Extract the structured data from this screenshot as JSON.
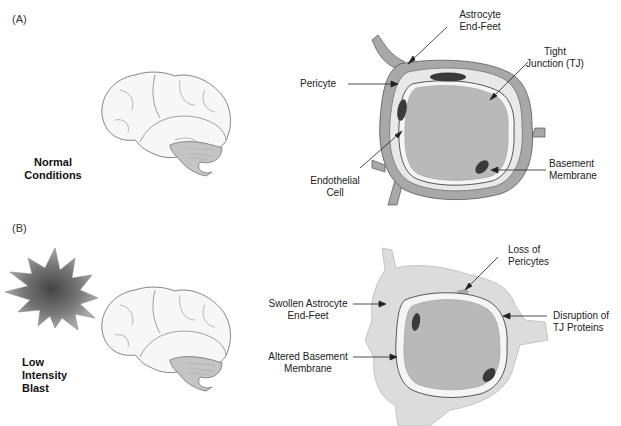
{
  "panels": [
    {
      "id": "A",
      "label": "(A)",
      "condition": [
        "Normal",
        "Conditions"
      ],
      "labels": {
        "astrocyte": [
          "Astrocyte",
          "End-Feet"
        ],
        "tight_junction": [
          "Tight",
          "Junction (TJ)"
        ],
        "pericyte": "Pericyte",
        "endothelial": [
          "Endothelial",
          "Cell"
        ],
        "basement": [
          "Basement",
          "Membrane"
        ]
      }
    },
    {
      "id": "B",
      "label": "(B)",
      "condition": [
        "Low",
        "Intensity",
        "Blast"
      ],
      "labels": {
        "loss_pericytes": [
          "Loss of",
          "Pericytes"
        ],
        "swollen": [
          "Swollen Astrocyte",
          "End-Feet"
        ],
        "disruption": [
          "Disruption of",
          "TJ Proteins"
        ],
        "altered": [
          "Altered Basement",
          "Membrane"
        ]
      }
    }
  ],
  "colors": {
    "astrocyte_normal": "#a8a8a8",
    "astrocyte_swollen": "#dcdcdc",
    "lumen": "#b9b9b9",
    "nucleus": "#3a3a3a",
    "pericyte": "#e8e8e8",
    "brain_fill": "#f7f7f7",
    "cerebellum": "#c4c4c4"
  },
  "icons": [
    "brain-illustration",
    "blast-starburst-icon",
    "blood-vessel-cross-section"
  ]
}
